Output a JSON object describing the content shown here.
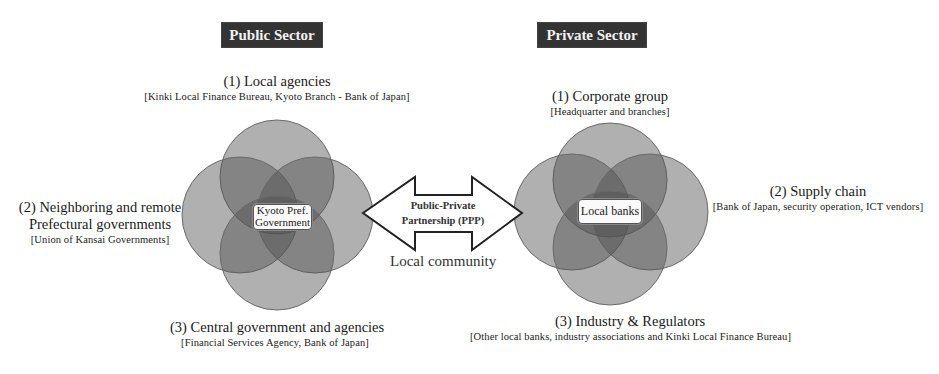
{
  "public_sector": {
    "title": "Public Sector",
    "center": [
      "Kyoto Pref.",
      "Government"
    ],
    "labels": [
      {
        "main": "(1)  Local agencies",
        "sub": "[Kinki Local Finance Bureau, Kyoto Branch - Bank of Japan]"
      },
      {
        "main_lines": [
          "(2) Neighboring and remote",
          "Prefectural governments"
        ],
        "sub": "[Union of Kansai  Governments]"
      },
      {
        "main": "(3) Central government and agencies",
        "sub": "[Financial Services Agency,  Bank of Japan]"
      }
    ]
  },
  "private_sector": {
    "title": "Private Sector",
    "center": "Local banks",
    "labels": [
      {
        "main": "(1)  Corporate group",
        "sub": "[Headquarter  and branches]"
      },
      {
        "main": "(2) Supply chain",
        "sub": "[Bank of Japan,  security operation, ICT vendors]"
      },
      {
        "main": "(3) Industry & Regulators",
        "sub": "[Other local banks,  industry associations and Kinki Local Finance Bureau]"
      }
    ]
  },
  "ppp_arrow": {
    "lines": [
      "Public-Private",
      "Partnership  (PPP)"
    ],
    "caption": "Local community"
  },
  "colors": {
    "sector_title_bg": "#333333",
    "circle_fill": "rgba(80,80,80,0.45)",
    "circle_stroke": "#6a6a6a",
    "arrow_stroke": "#222222"
  }
}
